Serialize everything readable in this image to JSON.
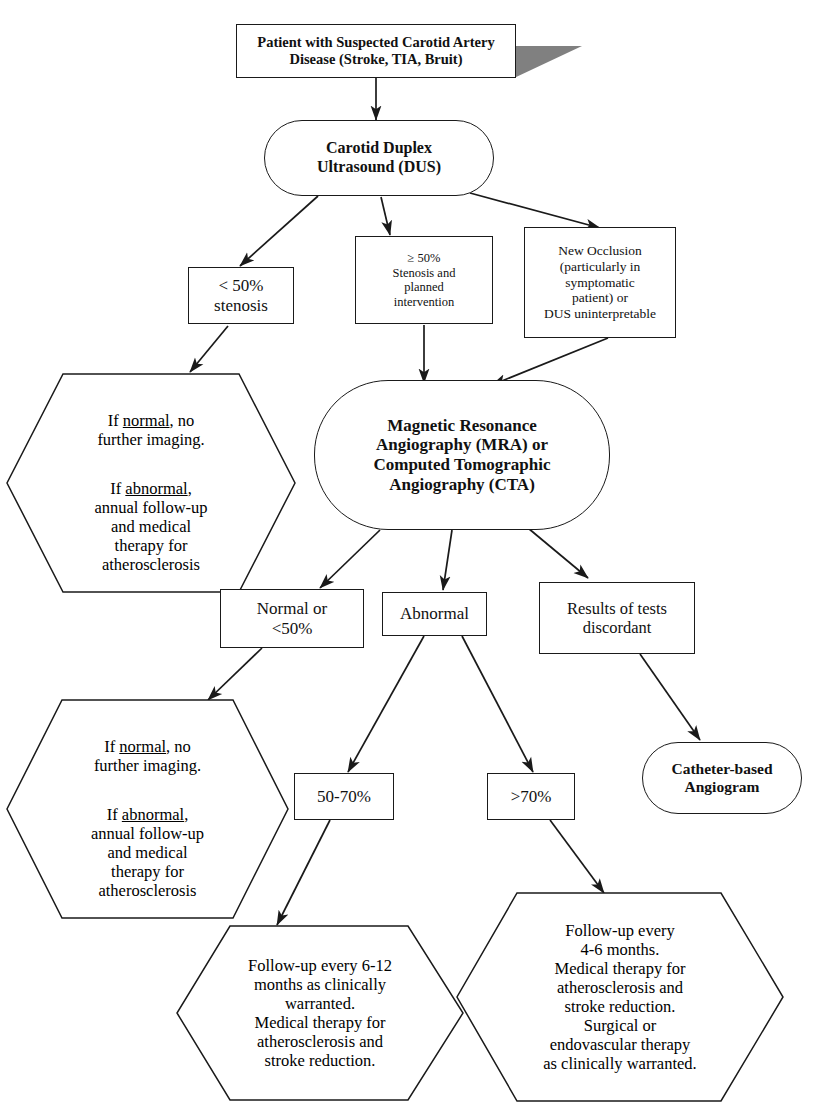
{
  "diagram": {
    "colors": {
      "stroke": "#1a1a1a",
      "fill": "#ffffff",
      "shadow": "#808080",
      "text": "#111111"
    }
  },
  "nodes": {
    "patient": {
      "label": "Patient with Suspected Carotid Artery\nDisease (Stroke, TIA, Bruit)",
      "shape": "rect-shadow"
    },
    "dus": {
      "label": "Carotid Duplex\nUltrasound (DUS)",
      "shape": "stadium"
    },
    "lt50": {
      "label": "< 50%\nstenosis",
      "shape": "rect"
    },
    "ge50": {
      "label": "≥ 50%\nStenosis and\nplanned\nintervention",
      "shape": "rect"
    },
    "occlusion": {
      "label": "New Occlusion\n(particularly in\nsymptomatic\npatient) or\nDUS uninterpretable",
      "shape": "rect"
    },
    "hex_top_left": {
      "line1": "If ",
      "word1": "normal",
      "line2": ", no\nfurther imaging.",
      "line3": "If ",
      "word2": "abnormal",
      "line4": ",\nannual follow-up\nand medical\ntherapy for\natherosclerosis",
      "shape": "hexagon"
    },
    "mra_cta": {
      "label": "Magnetic Resonance\nAngiography (MRA) or\nComputed Tomographic\nAngiography (CTA)",
      "shape": "stadium"
    },
    "normal_or": {
      "label": "Normal or\n<50%",
      "shape": "rect"
    },
    "abnormal": {
      "label": "Abnormal",
      "shape": "rect"
    },
    "discordant": {
      "label": "Results of tests\ndiscordant",
      "shape": "rect"
    },
    "hex_bottom_left": {
      "line1": "If ",
      "word1": "normal",
      "line2": ", no\nfurther imaging.",
      "line3": "If ",
      "word2": "abnormal",
      "line4": ",\nannual follow-up\nand medical\ntherapy for\natherosclerosis",
      "shape": "hexagon"
    },
    "sten_50_70": {
      "label": "50-70%",
      "shape": "rect"
    },
    "sten_gt70": {
      "label": ">70%",
      "shape": "rect"
    },
    "catheter": {
      "label": "Catheter-based\nAngiogram",
      "shape": "stadium"
    },
    "hex_followup_6_12": {
      "label": "Follow-up every 6-12\nmonths as clinically\nwarranted.\nMedical therapy for\natherosclerosis and\nstroke reduction.",
      "shape": "hexagon"
    },
    "hex_followup_4_6": {
      "label": "Follow-up every\n4-6 months.\nMedical therapy for\natherosclerosis and\nstroke reduction.\nSurgical or\nendovascular therapy\nas clinically warranted.",
      "shape": "hexagon"
    }
  },
  "edges": [
    {
      "from": "patient",
      "to": "dus"
    },
    {
      "from": "dus",
      "to": "lt50"
    },
    {
      "from": "dus",
      "to": "ge50"
    },
    {
      "from": "dus",
      "to": "occlusion"
    },
    {
      "from": "lt50",
      "to": "hex_top_left"
    },
    {
      "from": "ge50",
      "to": "mra_cta"
    },
    {
      "from": "occlusion",
      "to": "mra_cta"
    },
    {
      "from": "mra_cta",
      "to": "normal_or"
    },
    {
      "from": "mra_cta",
      "to": "abnormal"
    },
    {
      "from": "mra_cta",
      "to": "discordant"
    },
    {
      "from": "normal_or",
      "to": "hex_bottom_left"
    },
    {
      "from": "abnormal",
      "to": "sten_50_70"
    },
    {
      "from": "abnormal",
      "to": "sten_gt70"
    },
    {
      "from": "discordant",
      "to": "catheter"
    },
    {
      "from": "sten_50_70",
      "to": "hex_followup_6_12"
    },
    {
      "from": "sten_gt70",
      "to": "hex_followup_4_6"
    }
  ]
}
